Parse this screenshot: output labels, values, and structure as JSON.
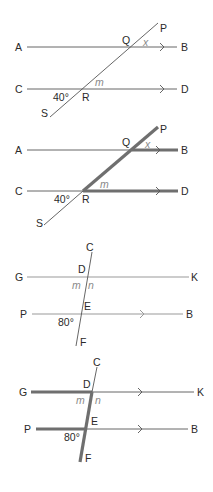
{
  "figures": [
    {
      "id": "fig1",
      "labels": {
        "A": "A",
        "B": "B",
        "C": "C",
        "D": "D",
        "P": "P",
        "Q": "Q",
        "R": "R",
        "S": "S"
      },
      "angles": {
        "x": "x",
        "m": "m",
        "given": "40°"
      }
    },
    {
      "id": "fig2",
      "labels": {
        "A": "A",
        "B": "B",
        "C": "C",
        "D": "D",
        "P": "P",
        "Q": "Q",
        "R": "R",
        "S": "S"
      },
      "angles": {
        "x": "x",
        "m": "m",
        "given": "40°"
      }
    },
    {
      "id": "fig3",
      "labels": {
        "C": "C",
        "D": "D",
        "E": "E",
        "F": "F",
        "G": "G",
        "K": "K",
        "P": "P",
        "B": "B"
      },
      "angles": {
        "m": "m",
        "n": "n",
        "given": "80°"
      }
    },
    {
      "id": "fig4",
      "labels": {
        "C": "C",
        "D": "D",
        "E": "E",
        "F": "F",
        "G": "G",
        "K": "K",
        "P": "P",
        "B": "B"
      },
      "angles": {
        "m": "m",
        "n": "n",
        "given": "80°"
      }
    }
  ],
  "colors": {
    "line": "#555555",
    "highlight": "#6f6f6f",
    "angle_label": "#8a8a8a",
    "text": "#2a2a2a"
  }
}
